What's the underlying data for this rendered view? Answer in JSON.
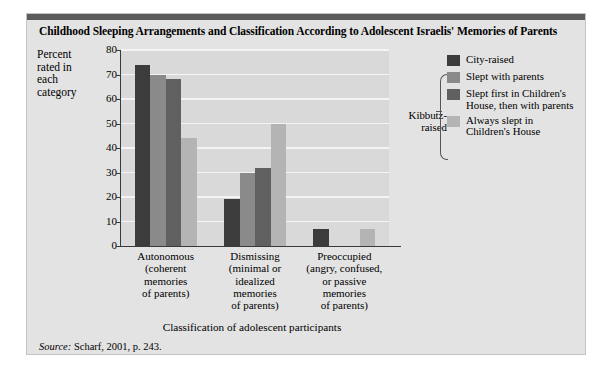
{
  "title": "Childhood Sleeping Arrangements and Classification According to Adolescent Israelis' Memories of Parents",
  "y_axis_caption": "Percent rated in each category",
  "x_axis_title": "Classification of adolescent participants",
  "source": "Scharf, 2001, p. 243.",
  "source_prefix": "Source:",
  "legend": {
    "group_label": "Kibbutz-raised",
    "items": [
      {
        "label": "City-raised",
        "color": "#3c3c3c"
      },
      {
        "label": "Slept with parents",
        "color": "#8a8a8a"
      },
      {
        "label": "Slept first in Children's House, then with parents",
        "color": "#606060"
      },
      {
        "label": "Always slept in Children's House",
        "color": "#b4b4b4"
      }
    ]
  },
  "chart_data": {
    "type": "bar",
    "title": "Childhood Sleeping Arrangements and Classification According to Adolescent Israelis' Memories of Parents",
    "xlabel": "Classification of adolescent participants",
    "ylabel": "Percent rated in each category",
    "ylim": [
      0,
      80
    ],
    "yticks": [
      0,
      10,
      20,
      30,
      40,
      50,
      60,
      70,
      80
    ],
    "grid": true,
    "legend_position": "right",
    "categories": [
      "Autonomous (coherent memories of parents)",
      "Dismissing (minimal or idealized memories of parents)",
      "Preoccupied (angry, confused, or passive memories of parents)"
    ],
    "category_lines": [
      [
        "Autonomous",
        "(coherent",
        "memories",
        "of parents)"
      ],
      [
        "Dismissing",
        "(minimal or",
        "idealized",
        "memories",
        "of parents)"
      ],
      [
        "Preoccupied",
        "(angry, confused,",
        "or passive",
        "memories",
        "of parents)"
      ]
    ],
    "series": [
      {
        "name": "City-raised",
        "color": "#3c3c3c",
        "values": [
          74,
          19,
          7
        ]
      },
      {
        "name": "Slept with parents",
        "color": "#8a8a8a",
        "values": [
          70,
          30,
          0
        ]
      },
      {
        "name": "Slept first in Children's House, then with parents",
        "color": "#606060",
        "values": [
          68,
          32,
          0
        ]
      },
      {
        "name": "Always slept in Children's House",
        "color": "#b4b4b4",
        "values": [
          44,
          50,
          7
        ]
      }
    ]
  }
}
